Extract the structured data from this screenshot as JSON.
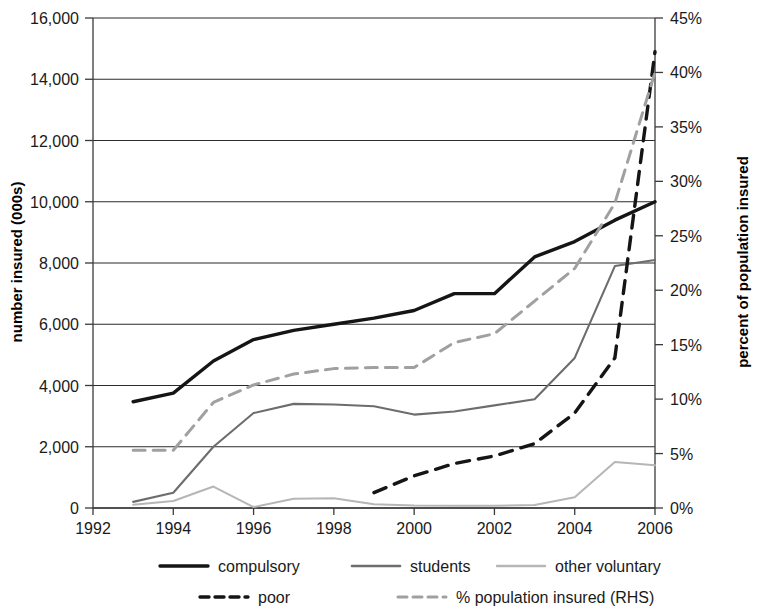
{
  "chart_data": {
    "type": "line",
    "title": "",
    "xlabel": "",
    "ylabel": "number insured (000s)",
    "y2label": "percent of population insured",
    "x": [
      1993,
      1994,
      1995,
      1996,
      1997,
      1998,
      1999,
      2000,
      2001,
      2002,
      2003,
      2004,
      2005,
      2006
    ],
    "xlim": [
      1992,
      2006
    ],
    "ylim": [
      0,
      16000
    ],
    "y2lim": [
      0,
      45
    ],
    "xticks": [
      "1992",
      "1994",
      "1996",
      "1998",
      "2000",
      "2002",
      "2004",
      "2006"
    ],
    "xtick_values": [
      1992,
      1994,
      1996,
      1998,
      2000,
      2002,
      2004,
      2006
    ],
    "yticks": [
      "0",
      "2,000",
      "4,000",
      "6,000",
      "8,000",
      "10,000",
      "12,000",
      "14,000",
      "16,000"
    ],
    "ytick_values": [
      0,
      2000,
      4000,
      6000,
      8000,
      10000,
      12000,
      14000,
      16000
    ],
    "y2ticks": [
      "0%",
      "5%",
      "10%",
      "15%",
      "20%",
      "25%",
      "30%",
      "35%",
      "40%",
      "45%"
    ],
    "y2tick_values": [
      0,
      5,
      10,
      15,
      20,
      25,
      30,
      35,
      40,
      45
    ],
    "grid": true,
    "legend_position": "bottom",
    "series": [
      {
        "name": "compulsory",
        "axis": "left",
        "style": "solid",
        "color": "#151515",
        "width": 3.4,
        "x": [
          1993,
          1994,
          1995,
          1996,
          1997,
          1998,
          1999,
          2000,
          2001,
          2002,
          2003,
          2004,
          2005,
          2006
        ],
        "values": [
          3470,
          3750,
          4800,
          5500,
          5800,
          6000,
          6200,
          6450,
          7000,
          7000,
          8200,
          8700,
          9400,
          10000
        ]
      },
      {
        "name": "students",
        "axis": "left",
        "style": "solid",
        "color": "#6d6d6d",
        "width": 2.1,
        "x": [
          1993,
          1994,
          1995,
          1996,
          1997,
          1998,
          1999,
          2000,
          2001,
          2002,
          2003,
          2004,
          2005,
          2006
        ],
        "values": [
          200,
          500,
          2000,
          3100,
          3400,
          3380,
          3320,
          3050,
          3150,
          3350,
          3550,
          4900,
          7900,
          8100
        ]
      },
      {
        "name": "other voluntary",
        "axis": "left",
        "style": "solid",
        "color": "#b6b6b6",
        "width": 2.0,
        "x": [
          1993,
          1994,
          1995,
          1996,
          1997,
          1998,
          1999,
          2000,
          2001,
          2002,
          2003,
          2004,
          2005,
          2006
        ],
        "values": [
          110,
          230,
          700,
          30,
          300,
          320,
          120,
          80,
          70,
          70,
          100,
          350,
          1500,
          1400
        ]
      },
      {
        "name": "poor",
        "axis": "left",
        "style": "dashed",
        "color": "#151515",
        "width": 3.4,
        "dash": "13,9",
        "x": [
          1999,
          2000,
          2001,
          2002,
          2003,
          2004,
          2005,
          2006
        ],
        "values": [
          500,
          1050,
          1450,
          1700,
          2100,
          3100,
          4900,
          14900
        ]
      },
      {
        "name": "% population insured (RHS)",
        "axis": "right",
        "style": "dashed",
        "color": "#a0a0a0",
        "width": 3.0,
        "dash": "12,8",
        "x": [
          1993,
          1994,
          1995,
          1996,
          1997,
          1998,
          1999,
          2000,
          2001,
          2002,
          2003,
          2004,
          2005,
          2006
        ],
        "values": [
          5.3,
          5.3,
          9.7,
          11.3,
          12.3,
          12.8,
          12.9,
          12.9,
          15.2,
          16.0,
          19.0,
          22.0,
          28.0,
          40.0
        ]
      }
    ],
    "legend": [
      {
        "label": "compulsory",
        "style": "solid",
        "color": "#151515",
        "width": 3.4
      },
      {
        "label": "students",
        "style": "solid",
        "color": "#6d6d6d",
        "width": 2.6
      },
      {
        "label": "other voluntary",
        "style": "solid",
        "color": "#b6b6b6",
        "width": 2.4
      },
      {
        "label": "poor",
        "style": "dashed",
        "color": "#151515",
        "width": 3.4,
        "dash": "9,6"
      },
      {
        "label": "% population insured (RHS)",
        "style": "dashed",
        "color": "#a0a0a0",
        "width": 3.0,
        "dash": "9,6"
      }
    ]
  }
}
